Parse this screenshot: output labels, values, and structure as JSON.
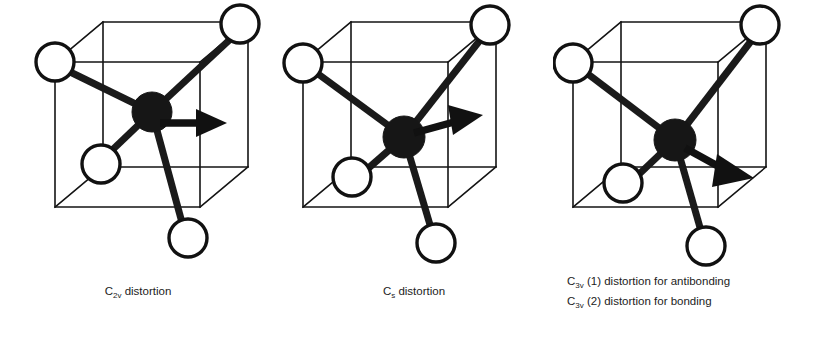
{
  "figure": {
    "background_color": "#ffffff",
    "ink_color": "#141414",
    "ligand_fill_color": "#ffffff",
    "center_atom_color": "#161616"
  },
  "panels": [
    {
      "id": "panel-1",
      "symmetry_label": "C",
      "symmetry_subscript": "2v",
      "caption_lines": [
        {
          "symbol": "C",
          "subscript": "2v",
          "text": " distortion"
        }
      ],
      "arrow_direction": "right",
      "arrow_description": "horizontal arrow pointing right from central atom"
    },
    {
      "id": "panel-2",
      "symmetry_label": "C",
      "symmetry_subscript": "s",
      "caption_lines": [
        {
          "symbol": "C",
          "subscript": "s",
          "text": " distortion"
        }
      ],
      "arrow_direction": "upper-right",
      "arrow_description": "arrow tilted upward to the right from central atom"
    },
    {
      "id": "panel-3",
      "symmetry_label": "C",
      "symmetry_subscript": "3v",
      "caption_lines": [
        {
          "symbol": "C",
          "subscript": "3v",
          "text": " (1) distortion for antibonding"
        },
        {
          "symbol": "C",
          "subscript": "3v",
          "text": " (2) distortion for bonding"
        }
      ],
      "arrow_direction": "lower-right",
      "arrow_description": "arrow tilted downward to the right toward cube corner"
    }
  ],
  "structure": {
    "description": "tetrahedral molecule inscribed in a cube",
    "ligand_count": 4,
    "center_atom_count": 1
  }
}
